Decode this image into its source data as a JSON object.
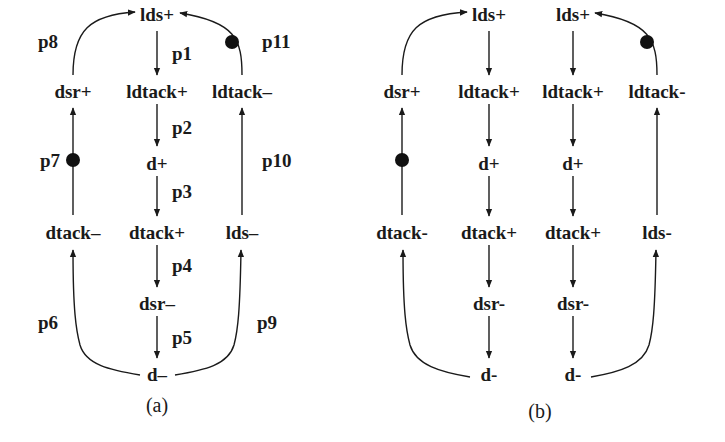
{
  "figure": {
    "panel_a": {
      "caption": "(a)",
      "nodes": {
        "lds_plus": "lds+",
        "ldtack_plus": "ldtack+",
        "d_plus": "d+",
        "dtack_plus": "dtack+",
        "dsr_minus": "dsr–",
        "d_minus": "d–",
        "dsr_plus": "dsr+",
        "dtack_minus": "dtack–",
        "ldtack_minus": "ldtack–",
        "lds_minus": "lds–"
      },
      "places": {
        "p1": "p1",
        "p2": "p2",
        "p3": "p3",
        "p4": "p4",
        "p5": "p5",
        "p6": "p6",
        "p7": "p7",
        "p8": "p8",
        "p9": "p9",
        "p10": "p10",
        "p11": "p11"
      },
      "marked_places": [
        "p7",
        "p11"
      ]
    },
    "panel_b": {
      "caption": "(b)",
      "nodes": {
        "dsr_plus": "dsr+",
        "dtack_minus": "dtack-",
        "c1_lds_plus": "lds+",
        "c1_ldtack_plus": "ldtack+",
        "c1_d_plus": "d+",
        "c1_dtack_plus": "dtack+",
        "c1_dsr_minus": "dsr-",
        "c1_d_minus": "d-",
        "c2_lds_plus": "lds+",
        "c2_ldtack_plus": "ldtack+",
        "c2_d_plus": "d+",
        "c2_dtack_plus": "dtack+",
        "c2_dsr_minus": "dsr-",
        "c2_d_minus": "d-",
        "ldtack_minus": "ldtack-",
        "lds_minus": "lds-"
      },
      "marked_places": 2
    }
  }
}
